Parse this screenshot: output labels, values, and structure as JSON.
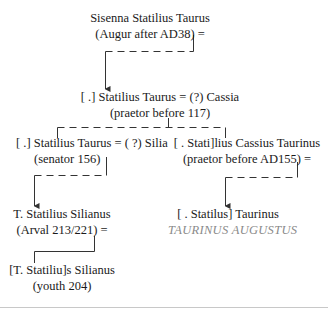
{
  "diagram": {
    "type": "family-tree",
    "nodes": [
      {
        "id": "sisenna",
        "line1": "Sisenna Statilius Taurus",
        "line2": "(Augur after AD38) ="
      },
      {
        "id": "statilius-taurus-1",
        "line1": "[ .] Statilius Taurus = (?) Cassia",
        "line2": "(praetor before 117)"
      },
      {
        "id": "statilius-taurus-2",
        "line1": "[ .] Statilius Taurus = ( ?) Silia",
        "line2": "(senator 156)"
      },
      {
        "id": "cassius-taurinus",
        "line1": "[   . Stati]lius Cassius Taurinus",
        "line2": "(praetor before AD155) ="
      },
      {
        "id": "silianus-arval",
        "line1": "T. Statilius Silianus",
        "line2": "(Arval 213/221) ="
      },
      {
        "id": "taurinus",
        "line1": "[   . Statilus] Taurinus",
        "line2": "TAURINUS AUGUSTUS"
      },
      {
        "id": "silianus-youth",
        "line1": "[T. Statiliu]s Silianus",
        "line2": "(youth 204)"
      }
    ],
    "edges": [
      {
        "from": "sisenna",
        "to": "statilius-taurus-1",
        "style": "dashed",
        "arrow": true
      },
      {
        "from": "statilius-taurus-1",
        "to": "statilius-taurus-2",
        "style": "dashed",
        "arrow": false
      },
      {
        "from": "statilius-taurus-1",
        "to": "cassius-taurinus",
        "style": "dashed",
        "arrow": false
      },
      {
        "from": "statilius-taurus-2",
        "to": "silianus-arval",
        "style": "dashed",
        "arrow": true
      },
      {
        "from": "cassius-taurinus",
        "to": "taurinus",
        "style": "dashed",
        "arrow": true
      },
      {
        "from": "silianus-arval",
        "to": "silianus-youth",
        "style": "solid",
        "arrow": false
      }
    ],
    "colors": {
      "text": "#1a1a1a",
      "lines": "#333333",
      "grey_text": "#8a8a8a",
      "divider": "#c8c8c8"
    }
  }
}
